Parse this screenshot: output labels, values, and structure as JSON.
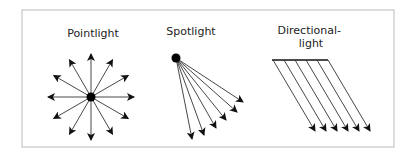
{
  "diagram": {
    "frame": {
      "x": 22,
      "y": 10,
      "width": 372,
      "height": 137,
      "stroke": "#bbbbbb"
    },
    "colors": {
      "line": "#333333",
      "dot": "#000000",
      "text": "#222222"
    },
    "panels": [
      {
        "id": "pointlight",
        "label_lines": [
          "Pointlight"
        ],
        "label_x": 93,
        "label_y": [
          37
        ],
        "source": {
          "cx": 91,
          "cy": 97,
          "r": 4.5
        },
        "ray_count": 12,
        "ray_length": 43
      },
      {
        "id": "spotlight",
        "label_lines": [
          "Spotlight"
        ],
        "label_x": 191,
        "label_y": [
          35
        ],
        "source": {
          "cx": 176,
          "cy": 58,
          "r": 4.5
        },
        "ray_tips": [
          [
            243,
            102
          ],
          [
            237,
            112
          ],
          [
            226,
            120
          ],
          [
            216,
            128
          ],
          [
            204,
            135
          ],
          [
            192,
            139
          ]
        ]
      },
      {
        "id": "directional",
        "label_lines": [
          "Directional-",
          "light"
        ],
        "label_x": 311,
        "label_y": [
          34,
          47
        ],
        "bar": {
          "x1": 272,
          "x2": 328,
          "y": 60
        },
        "ray_starts_x": [
          273,
          284,
          295,
          306,
          317,
          328
        ],
        "ray_dx": 42,
        "ray_end_y": 131
      }
    ]
  }
}
